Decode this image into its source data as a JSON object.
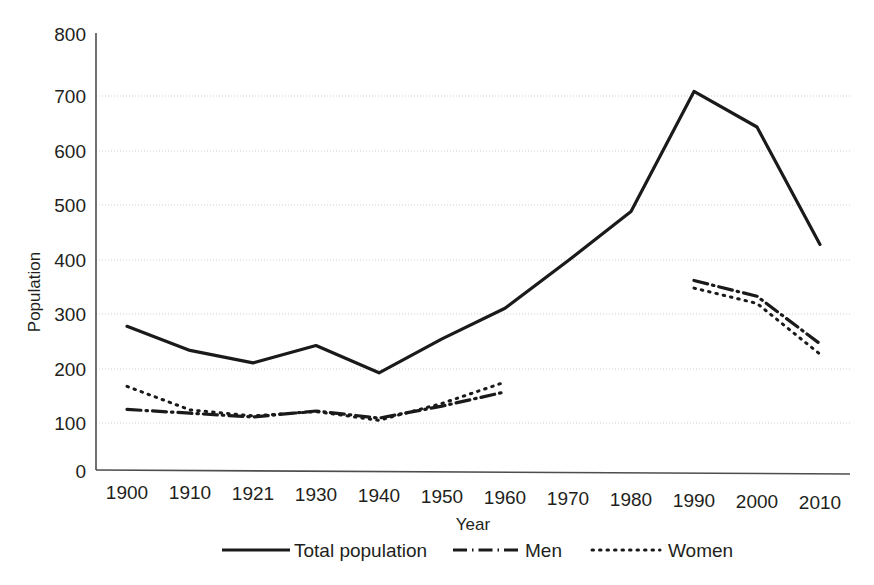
{
  "chart_data": {
    "type": "line",
    "title": "",
    "xlabel": "Year",
    "ylabel": "Population",
    "x": [
      1900,
      1910,
      1921,
      1930,
      1940,
      1950,
      1960,
      1970,
      1980,
      1990,
      2000,
      2010
    ],
    "xticklabels": [
      "1900",
      "1910",
      "1921",
      "1930",
      "1940",
      "1950",
      "1960",
      "1970",
      "1980",
      "1990",
      "2000",
      "2010"
    ],
    "yticklabels": [
      "0",
      "100",
      "200",
      "300",
      "400",
      "500",
      "600",
      "700",
      "800"
    ],
    "yticks": [
      0,
      100,
      200,
      300,
      400,
      500,
      600,
      700,
      800
    ],
    "ylim": [
      0,
      800
    ],
    "grid": "horizontal-dotted",
    "legend_position": "bottom-center",
    "series": [
      {
        "name": "Total population",
        "style": "solid",
        "color": "#1a1a1a",
        "x": [
          1900,
          1910,
          1921,
          1930,
          1940,
          1950,
          1960,
          1970,
          1980,
          1990,
          2000,
          2010
        ],
        "values": [
          263,
          219,
          196,
          228,
          178,
          240,
          296,
          383,
          473,
          693,
          628,
          413
        ]
      },
      {
        "name": "Men",
        "style": "dash-dot",
        "color": "#1a1a1a",
        "x": [
          1900,
          1910,
          1921,
          1930,
          1940,
          1950,
          1960,
          1990,
          2000,
          2010
        ],
        "segments": [
          {
            "x": [
              1900,
              1910,
              1921,
              1930,
              1940,
              1950,
              1960
            ],
            "values": [
              111,
              104,
              97,
              108,
              95,
              117,
              143
            ]
          },
          {
            "x": [
              1990,
              2000,
              2010
            ],
            "values": [
              347,
              318,
              231
            ]
          }
        ]
      },
      {
        "name": "Women",
        "style": "dotted",
        "color": "#1a1a1a",
        "x": [
          1900,
          1910,
          1921,
          1930,
          1940,
          1950,
          1960,
          1990,
          2000,
          2010
        ],
        "segments": [
          {
            "x": [
              1900,
              1910,
              1921,
              1930,
              1940,
              1950,
              1960
            ],
            "values": [
              153,
              110,
              99,
              107,
              91,
              122,
              161
            ]
          },
          {
            "x": [
              1990,
              2000,
              2010
            ],
            "values": [
              333,
              305,
              212
            ]
          }
        ]
      }
    ]
  },
  "axes": {
    "y_title": "Population",
    "x_title": "Year",
    "y_labels": [
      "800",
      "700",
      "600",
      "500",
      "400",
      "300",
      "200",
      "100",
      "0"
    ],
    "x_labels": [
      "1900",
      "1910",
      "1921",
      "1930",
      "1940",
      "1950",
      "1960",
      "1970",
      "1980",
      "1990",
      "2000",
      "2010"
    ]
  },
  "legend": {
    "items": [
      {
        "label": "Total population",
        "style": "solid"
      },
      {
        "label": "Men",
        "style": "dash-dot"
      },
      {
        "label": "Women",
        "style": "dotted"
      }
    ]
  }
}
